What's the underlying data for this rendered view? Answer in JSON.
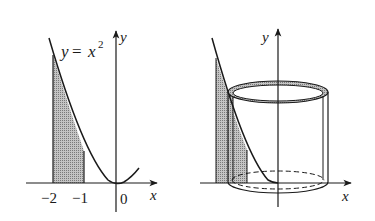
{
  "figure_left": {
    "equation": {
      "lhs": "y",
      "eq": "=",
      "base": "x",
      "exp": "2"
    },
    "axis_x_label": "x",
    "axis_y_label": "y",
    "tick_labels": [
      "−2",
      "−1",
      "0"
    ],
    "shaded_interval": [
      -2,
      -1
    ]
  },
  "figure_right": {
    "axis_x_label": "x",
    "axis_y_label": "y",
    "description": "Cylindrical shell formed by rotating shaded strip of region under y = x^2 about the y-axis"
  },
  "colors": {
    "ink": "#1a1a1a",
    "shade": "#9a9a9a",
    "background": "#ffffff"
  }
}
